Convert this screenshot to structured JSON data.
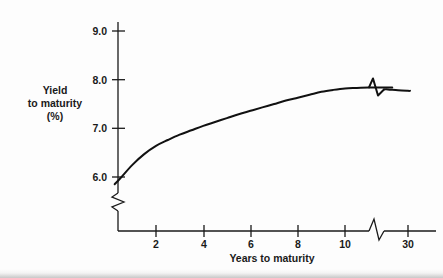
{
  "figure": {
    "caption_none": "",
    "background_color": "#fdfdfd",
    "line_color": "#111111",
    "text_color": "#1a1a1a"
  },
  "axes": {
    "y_title_line1": "Yield",
    "y_title_line2": "to maturity",
    "y_title_line3": "(%)",
    "x_title": "Years to maturity",
    "y_ticks": [
      "6.0",
      "7.0",
      "8.0",
      "9.0"
    ],
    "x_ticks": [
      "2",
      "4",
      "6",
      "8",
      "10",
      "30"
    ],
    "y_axis_break": "zigzag-break",
    "x_axis_break": "zigzag-break"
  },
  "chart_data": {
    "type": "line",
    "title": "",
    "subtitle": "",
    "xlabel": "Years to maturity",
    "ylabel": "Yield to maturity (%)",
    "xlim": [
      0,
      31
    ],
    "ylim": [
      5.4,
      9.3
    ],
    "xticks": [
      2,
      4,
      6,
      8,
      10,
      30
    ],
    "xticklabels": [
      "2",
      "4",
      "6",
      "8",
      "10",
      "30"
    ],
    "yticks": [
      6.0,
      7.0,
      8.0,
      9.0
    ],
    "yticklabels": [
      "6.0",
      "7.0",
      "8.0",
      "9.0"
    ],
    "grid": false,
    "legend": null,
    "axis_breaks": {
      "y_axis_below": 6.0,
      "x_axis_between": [
        12,
        20
      ]
    },
    "annotations": [],
    "series": [
      {
        "name": "Treasury yield curve",
        "color": "#111111",
        "x": [
          0.25,
          0.5,
          1.0,
          1.5,
          2.0,
          2.5,
          3.0,
          3.5,
          4.0,
          4.5,
          5.0,
          5.5,
          6.0,
          6.5,
          7.0,
          7.5,
          8.0,
          8.5,
          9.0,
          9.5,
          10.0,
          10.5,
          11.0,
          11.5,
          12.0,
          20.0,
          25.0,
          30.0,
          31.0
        ],
        "y": [
          5.85,
          5.98,
          6.25,
          6.47,
          6.64,
          6.76,
          6.87,
          6.96,
          7.05,
          7.13,
          7.21,
          7.29,
          7.36,
          7.43,
          7.5,
          7.57,
          7.63,
          7.69,
          7.75,
          7.79,
          7.82,
          7.83,
          7.84,
          7.84,
          7.84,
          7.8,
          7.78,
          7.77,
          7.77
        ]
      }
    ]
  }
}
